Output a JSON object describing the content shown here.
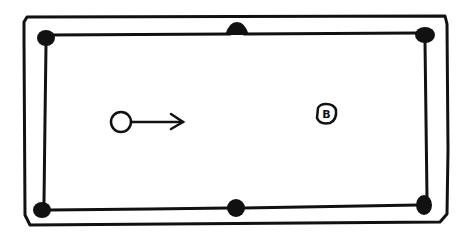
{
  "diagram": {
    "type": "pool-table-sketch",
    "table": {
      "outer_rail": {
        "x": 24,
        "y": 17,
        "w": 426,
        "h": 208
      },
      "inner_cushion": {
        "x": 44,
        "y": 35,
        "w": 384,
        "h": 175
      },
      "pockets": [
        {
          "id": "top-left",
          "cx": 45,
          "cy": 37
        },
        {
          "id": "top-middle",
          "cx": 237,
          "cy": 31
        },
        {
          "id": "top-right",
          "cx": 425,
          "cy": 34
        },
        {
          "id": "bottom-left",
          "cx": 42,
          "cy": 210
        },
        {
          "id": "bottom-middle",
          "cx": 236,
          "cy": 208
        },
        {
          "id": "bottom-right",
          "cx": 425,
          "cy": 205
        }
      ]
    },
    "cue_ball": {
      "cx": 121,
      "cy": 122,
      "r": 10
    },
    "aim_arrow": {
      "x1": 131,
      "y1": 122,
      "x2": 183,
      "y2": 122
    },
    "object_ball": {
      "cx": 326,
      "cy": 114,
      "r": 10,
      "label": "B"
    },
    "colors": {
      "ink": "#111111",
      "background": "#ffffff"
    }
  }
}
